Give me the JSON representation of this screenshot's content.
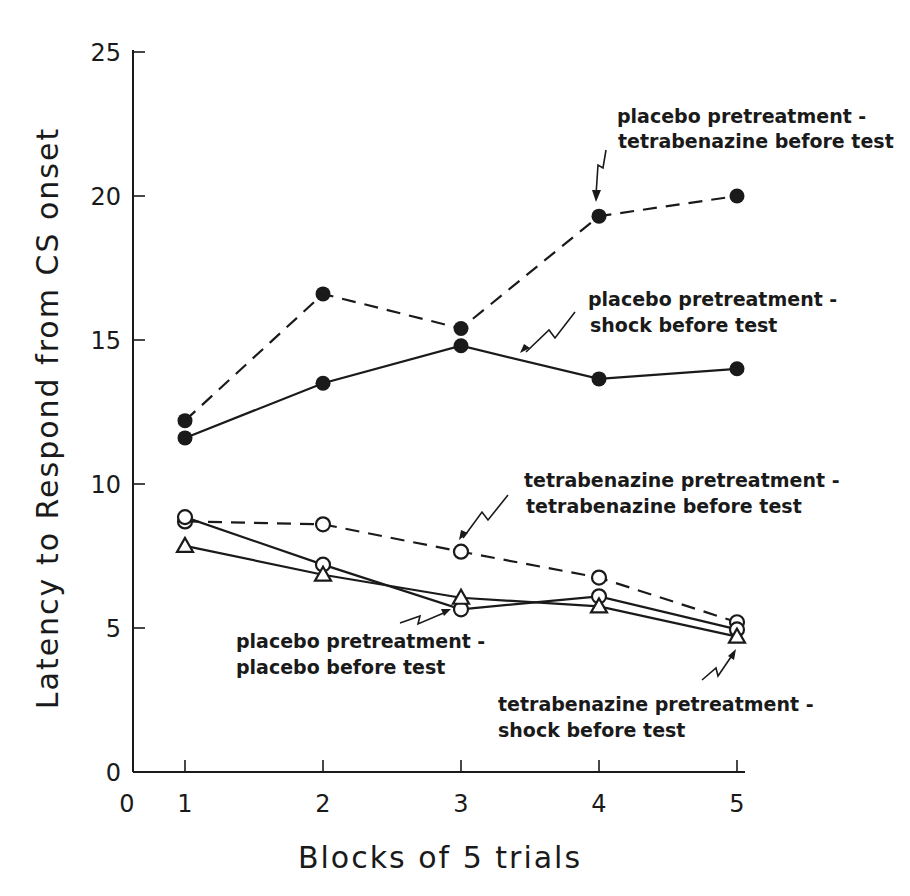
{
  "chart_data": {
    "type": "line",
    "title": "",
    "xlabel": "Blocks of 5 trials",
    "ylabel": "Latency to Respond from CS onset",
    "x": [
      1,
      2,
      3,
      4,
      5
    ],
    "xlim": [
      0,
      5
    ],
    "ylim": [
      0,
      25
    ],
    "x_ticks": [
      "0",
      "1",
      "2",
      "3",
      "4",
      "5"
    ],
    "y_ticks": [
      "0",
      "5",
      "10",
      "15",
      "20",
      "25"
    ],
    "grid": false,
    "legend": "inline annotations with arrows",
    "series": [
      {
        "name": "placebo pretreatment - tetrabenazine before test",
        "marker": "filled-circle",
        "line": "dashed",
        "values": [
          12.2,
          16.6,
          15.4,
          19.3,
          20.0
        ]
      },
      {
        "name": "placebo pretreatment - shock before test",
        "marker": "filled-circle",
        "line": "solid",
        "values": [
          11.6,
          13.5,
          14.8,
          13.65,
          14.0
        ]
      },
      {
        "name": "tetrabenazine pretreatment - tetrabenazine before test",
        "marker": "open-circle",
        "line": "dashed",
        "values": [
          8.7,
          8.6,
          7.65,
          6.75,
          5.2
        ]
      },
      {
        "name": "placebo pretreatment - placebo before test",
        "marker": "open-circle",
        "line": "solid",
        "values": [
          8.85,
          7.2,
          5.65,
          6.1,
          4.95
        ]
      },
      {
        "name": "tetrabenazine pretreatment - shock before test",
        "marker": "open-triangle",
        "line": "solid",
        "values": [
          7.85,
          6.85,
          6.05,
          5.75,
          4.7
        ]
      }
    ]
  },
  "annotations": [
    {
      "line1": "placebo pretreatment -",
      "line2": "tetrabenazine before test"
    },
    {
      "line1": "placebo pretreatment -",
      "line2": "shock before test"
    },
    {
      "line1": "tetrabenazine pretreatment -",
      "line2": "tetrabenazine before test"
    },
    {
      "line1": "placebo pretreatment -",
      "line2": "placebo before test"
    },
    {
      "line1": "tetrabenazine pretreatment -",
      "line2": "shock before test"
    }
  ]
}
